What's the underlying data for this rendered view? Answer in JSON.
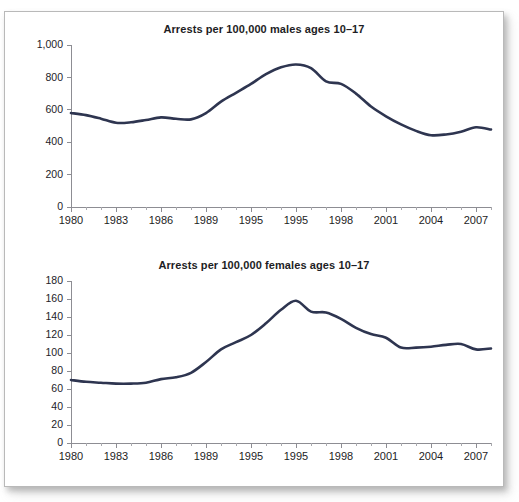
{
  "page": {
    "cut_off_caption": "",
    "line_color": "#2e3550",
    "axis_color": "#8d8d93",
    "panel_background": "#ffffff"
  },
  "charts": [
    {
      "id": "males",
      "name": "arrests-males-chart",
      "chart_data": {
        "type": "line",
        "title": "Arrests per 100,000 males ages 10–17",
        "xlabel": "",
        "ylabel": "",
        "grid": false,
        "legend": "none",
        "line_color": "#2e3550",
        "ylim": [
          0,
          1000
        ],
        "yticks": [
          0,
          200,
          400,
          600,
          800,
          1000
        ],
        "ytick_labels": [
          "0",
          "200",
          "400",
          "600",
          "800",
          "1,000"
        ],
        "xlim": [
          1980,
          2008
        ],
        "xticks": [
          1980,
          1983,
          1986,
          1989,
          1992,
          1995,
          1998,
          2001,
          2004,
          2007
        ],
        "xtick_labels": [
          "1980",
          "1983",
          "1986",
          "1989",
          "1995",
          "1995",
          "1998",
          "2001",
          "2004",
          "2007"
        ],
        "x": [
          1980,
          1981,
          1982,
          1983,
          1984,
          1985,
          1986,
          1987,
          1988,
          1989,
          1990,
          1991,
          1992,
          1993,
          1994,
          1995,
          1996,
          1997,
          1998,
          1999,
          2000,
          2001,
          2002,
          2003,
          2004,
          2005,
          2006,
          2007,
          2008
        ],
        "values": [
          580,
          567,
          545,
          520,
          523,
          537,
          553,
          545,
          541,
          580,
          650,
          705,
          760,
          820,
          862,
          880,
          857,
          775,
          760,
          700,
          620,
          560,
          510,
          470,
          443,
          448,
          465,
          492,
          478
        ]
      }
    },
    {
      "id": "females",
      "name": "arrests-females-chart",
      "chart_data": {
        "type": "line",
        "title": "Arrests per 100,000 females ages 10–17",
        "xlabel": "",
        "ylabel": "",
        "grid": false,
        "legend": "none",
        "line_color": "#2e3550",
        "ylim": [
          0,
          180
        ],
        "yticks": [
          0,
          20,
          40,
          60,
          80,
          100,
          120,
          140,
          160,
          180
        ],
        "ytick_labels": [
          "0",
          "20",
          "40",
          "60",
          "80",
          "100",
          "120",
          "140",
          "160",
          "180"
        ],
        "xlim": [
          1980,
          2008
        ],
        "xticks": [
          1980,
          1983,
          1986,
          1989,
          1992,
          1995,
          1998,
          2001,
          2004,
          2007
        ],
        "xtick_labels": [
          "1980",
          "1983",
          "1986",
          "1989",
          "1995",
          "1995",
          "1998",
          "2001",
          "2004",
          "2007"
        ],
        "x": [
          1980,
          1981,
          1982,
          1983,
          1984,
          1985,
          1986,
          1987,
          1988,
          1989,
          1990,
          1991,
          1992,
          1993,
          1994,
          1995,
          1996,
          1997,
          1998,
          1999,
          2000,
          2001,
          2002,
          2003,
          2004,
          2005,
          2006,
          2007,
          2008
        ],
        "values": [
          70,
          68,
          67,
          66,
          66,
          67,
          71,
          73,
          78,
          90,
          104,
          112,
          120,
          133,
          148,
          158,
          146,
          145,
          138,
          128,
          121,
          117,
          106,
          106,
          107,
          109,
          110,
          104,
          105
        ]
      }
    }
  ]
}
